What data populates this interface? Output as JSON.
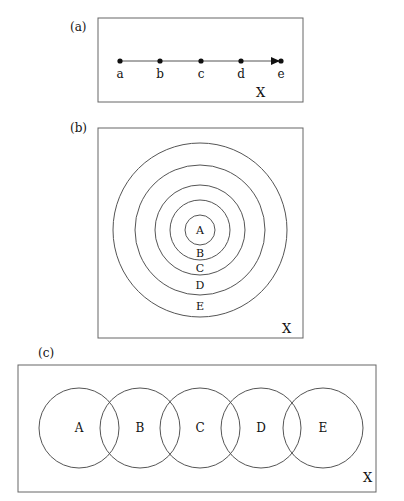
{
  "panel_a": {
    "tag": "(a)",
    "points": [
      {
        "label": "a",
        "x": 120
      },
      {
        "label": "b",
        "x": 160
      },
      {
        "label": "c",
        "x": 201
      },
      {
        "label": "d",
        "x": 241
      },
      {
        "label": "e",
        "x": 281
      }
    ],
    "space_label": "X"
  },
  "panel_b": {
    "tag": "(b)",
    "rings": [
      {
        "label": "A",
        "r": 15
      },
      {
        "label": "B",
        "r": 30
      },
      {
        "label": "C",
        "r": 45
      },
      {
        "label": "D",
        "r": 65
      },
      {
        "label": "E",
        "r": 87
      }
    ],
    "space_label": "X"
  },
  "panel_c": {
    "tag": "(c)",
    "circles": [
      {
        "label": "A",
        "cx": 79
      },
      {
        "label": "B",
        "cx": 140
      },
      {
        "label": "C",
        "cx": 200
      },
      {
        "label": "D",
        "cx": 261
      },
      {
        "label": "E",
        "cx": 323
      }
    ],
    "space_label": "X"
  },
  "colors": {
    "stroke": "#555555",
    "text": "#111111"
  }
}
